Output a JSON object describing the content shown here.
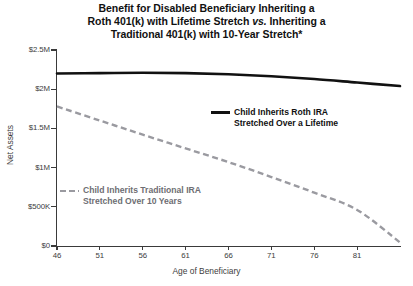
{
  "chart_data": {
    "type": "line",
    "title": "Benefit for Disabled Beneficiary Inheriting a Roth 401(k) with Lifetime Stretch vs. Inheriting a Traditional 401(k) with 10-Year Stretch*",
    "title_lines": [
      "Benefit for Disabled Beneficiary Inheriting a",
      "Roth 401(k) with Lifetime Stretch vs. Inheriting a",
      "Traditional 401(k) with 10-Year Stretch*"
    ],
    "title_line2_pre": "Roth 401(k) with Lifetime Stretch ",
    "title_line2_italic": "vs.",
    "title_line2_post": " Inheriting a",
    "xlabel": "Age of Beneficiary",
    "ylabel": "Net Assets",
    "xlim": [
      46,
      86
    ],
    "ylim": [
      0,
      2500000
    ],
    "grid": false,
    "legend_position": "inline-annotations",
    "xticks": [
      46,
      51,
      56,
      61,
      66,
      71,
      76,
      81
    ],
    "xtick_labels": [
      "46",
      "51",
      "56",
      "61",
      "66",
      "71",
      "76",
      "81"
    ],
    "yticks": [
      0,
      500000,
      1000000,
      1500000,
      2000000,
      2500000
    ],
    "ytick_labels": [
      "$0",
      "$500K",
      "$1M",
      "$1.5M",
      "$2M",
      "$2.5M"
    ],
    "x": [
      46,
      51,
      56,
      61,
      66,
      71,
      76,
      81,
      86
    ],
    "series": [
      {
        "name": "Child Inherits Roth IRA Stretched Over a Lifetime",
        "style": "solid",
        "color": "#111111",
        "values": [
          2200000,
          2205000,
          2210000,
          2205000,
          2190000,
          2165000,
          2130000,
          2085000,
          2040000
        ]
      },
      {
        "name": "Child Inherits Traditional IRA Stretched Over 10 Years",
        "style": "dashed",
        "color": "#9a9aa0",
        "values": [
          1780000,
          1600000,
          1420000,
          1245000,
          1070000,
          880000,
          680000,
          460000,
          45000
        ]
      }
    ]
  },
  "legends": [
    {
      "id": "roth",
      "line1": "Child Inherits Roth IRA",
      "line2": "Stretched Over a Lifetime",
      "swatch": "solid-line-swatch",
      "color": "#111111"
    },
    {
      "id": "traditional",
      "line1": "Child Inherits Traditional IRA",
      "line2": "Stretched Over 10 Years",
      "swatch": "dashed-line-swatch",
      "color": "#9a9aa0"
    }
  ]
}
